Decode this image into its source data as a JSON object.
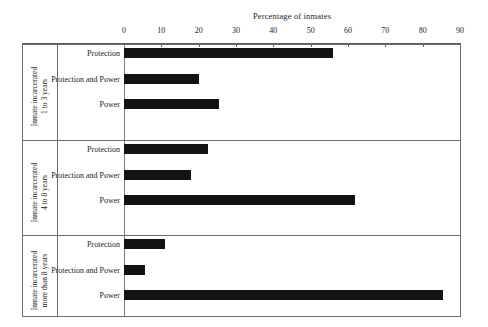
{
  "chart_data": {
    "type": "bar",
    "orientation": "horizontal",
    "title": "Percentage of inmates",
    "xlabel": "",
    "ylabel": "",
    "xlim": [
      0,
      90
    ],
    "xticks": [
      0,
      10,
      20,
      30,
      40,
      50,
      60,
      70,
      80,
      90
    ],
    "grid": false,
    "legend": null,
    "categories": [
      "Protection",
      "Protection and Power",
      "Power"
    ],
    "panels": [
      {
        "caption": "Inmate incarcerated\n1 to 3 years",
        "bars": [
          {
            "label": "Protection",
            "value": 56
          },
          {
            "label": "Protection and Power",
            "value": 20
          },
          {
            "label": "Power",
            "value": 25.5
          }
        ]
      },
      {
        "caption": "Inmate incarcerated\n4 to 8 years",
        "bars": [
          {
            "label": "Protection",
            "value": 22.5
          },
          {
            "label": "Protection and Power",
            "value": 18
          },
          {
            "label": "Power",
            "value": 62
          }
        ]
      },
      {
        "caption": "Inmate incarcerated\nmore than 8 years",
        "bars": [
          {
            "label": "Protection",
            "value": 11
          },
          {
            "label": "Protection and Power",
            "value": 5.5
          },
          {
            "label": "Power",
            "value": 85.5
          }
        ]
      }
    ],
    "colors": {
      "bar": "#131313",
      "axis": "#5a5a5a",
      "frame": "#6b6b6b",
      "text": "#1c1c1c",
      "background": "#ffffff"
    }
  }
}
